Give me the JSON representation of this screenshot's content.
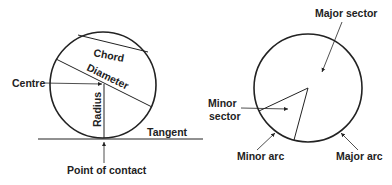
{
  "left_diagram": {
    "labels": {
      "chord": "Chord",
      "diameter": "Diameter",
      "centre": "Centre",
      "radius": "Radius",
      "tangent": "Tangent",
      "point_of_contact": "Point of contact"
    }
  },
  "right_diagram": {
    "labels": {
      "major_sector": "Major sector",
      "minor_sector_line1": "Minor",
      "minor_sector_line2": "sector",
      "minor_arc": "Minor arc",
      "major_arc": "Major arc"
    }
  },
  "colors": {
    "stroke": "#222222",
    "background": "#ffffff"
  }
}
